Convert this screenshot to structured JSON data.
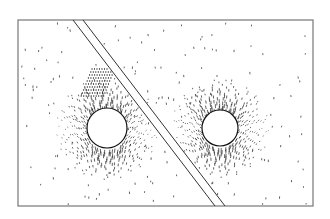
{
  "figure": {
    "frame": {
      "x": 18,
      "y": 20,
      "width": 295,
      "height": 186,
      "stroke": "#777777"
    },
    "channel": {
      "line_a": {
        "x1": 73,
        "y1": 20,
        "x2": 215,
        "y2": 206
      },
      "line_b": {
        "x1": 83,
        "y1": 20,
        "x2": 225,
        "y2": 206
      },
      "stroke": "#333333"
    },
    "bodies": [
      {
        "name": "left-body",
        "cx": 107,
        "cy": 128,
        "r": 20
      },
      {
        "name": "right-body",
        "cx": 220,
        "cy": 128,
        "r": 18
      }
    ],
    "colors": {
      "vector": "#222222",
      "background": "#ffffff"
    }
  }
}
